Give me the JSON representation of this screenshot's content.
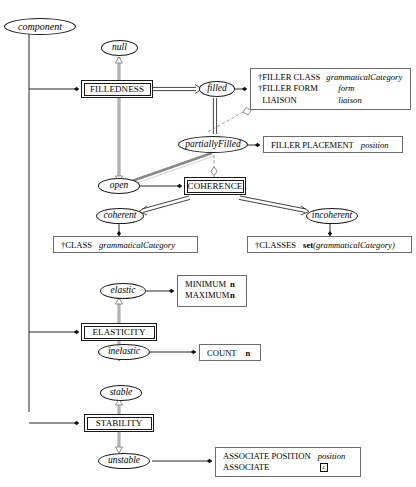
{
  "diagram": {
    "type": "state-transition-attribute-diagram",
    "title": "component",
    "colors": {
      "stroke": "#1a1a1a",
      "thick_gray": "#9a9a9a",
      "box_border": "#6b6b6b",
      "background": "#ffffff"
    },
    "root": {
      "label": "component"
    },
    "states": [
      {
        "id": "null",
        "label": "null"
      },
      {
        "id": "filled",
        "label": "filled"
      },
      {
        "id": "partiallyFilled",
        "label": "partiallyFilled"
      },
      {
        "id": "open",
        "label": "open"
      },
      {
        "id": "coherent",
        "label": "coherent"
      },
      {
        "id": "incoherent",
        "label": "incoherent"
      },
      {
        "id": "elastic",
        "label": "elastic"
      },
      {
        "id": "inelastic",
        "label": "inelastic"
      },
      {
        "id": "stable",
        "label": "stable"
      },
      {
        "id": "unstable",
        "label": "unstable"
      }
    ],
    "classes": [
      {
        "id": "filledness",
        "label": "FILLEDNESS"
      },
      {
        "id": "coherence",
        "label": "COHERENCE"
      },
      {
        "id": "elasticity",
        "label": "ELASTICITY"
      },
      {
        "id": "stability",
        "label": "STABILITY"
      }
    ],
    "attribute_boxes": [
      {
        "id": "filler-class-box",
        "rows": [
          {
            "dagger": true,
            "name": "FILLER CLASS",
            "value": "grammaticalCategory"
          },
          {
            "dagger": true,
            "name": "FILLER FORM",
            "value": "form"
          },
          {
            "dagger": false,
            "name": "LIAISON",
            "value": "liaison"
          }
        ]
      },
      {
        "id": "filler-placement-box",
        "rows": [
          {
            "dagger": false,
            "name": "FILLER PLACEMENT",
            "value": "position"
          }
        ]
      },
      {
        "id": "class-box",
        "rows": [
          {
            "dagger": true,
            "name": "CLASS",
            "value": "grammaticalCategory"
          }
        ]
      },
      {
        "id": "classes-box",
        "rows": [
          {
            "dagger": true,
            "name": "CLASSES",
            "value": "set(grammaticalCategory)",
            "value_kind": "set"
          }
        ]
      },
      {
        "id": "minmax-box",
        "rows": [
          {
            "dagger": false,
            "name": "MINIMUM",
            "value": "n",
            "value_kind": "bold"
          },
          {
            "dagger": false,
            "name": "MAXIMUM",
            "value": "n",
            "value_kind": "bold"
          }
        ]
      },
      {
        "id": "count-box",
        "rows": [
          {
            "dagger": false,
            "name": "COUNT",
            "value": "n",
            "value_kind": "bold"
          }
        ]
      },
      {
        "id": "associate-box",
        "rows": [
          {
            "dagger": false,
            "name": "ASSOCIATE POSITION",
            "value": "position"
          },
          {
            "dagger": false,
            "name": "ASSOCIATE",
            "value": "c",
            "value_kind": "boxed"
          }
        ]
      }
    ],
    "labels": {
      "component": "component",
      "null": "null",
      "filled": "filled",
      "partiallyFilled": "partiallyFilled",
      "open": "open",
      "coherent": "coherent",
      "incoherent": "incoherent",
      "elastic": "elastic",
      "inelastic": "inelastic",
      "stable": "stable",
      "unstable": "unstable",
      "FILLEDNESS": "FILLEDNESS",
      "COHERENCE": "COHERENCE",
      "ELASTICITY": "ELASTICITY",
      "STABILITY": "STABILITY",
      "filler_class_name": "FILLER CLASS",
      "filler_class_value": "grammaticalCategory",
      "filler_form_name": "FILLER FORM",
      "filler_form_value": "form",
      "liaison_name": "LIAISON",
      "liaison_value": "liaison",
      "filler_placement_name": "FILLER PLACEMENT",
      "filler_placement_value": "position",
      "class_name": "CLASS",
      "class_value": "grammaticalCategory",
      "classes_name": "CLASSES",
      "classes_value_fn": "set",
      "classes_value_arg": "(grammaticalCategory)",
      "minimum_name": "MINIMUM",
      "minimum_value": "n",
      "maximum_name": "MAXIMUM",
      "maximum_value": "n",
      "count_name": "COUNT",
      "count_value": "n",
      "associate_position_name": "ASSOCIATE POSITION",
      "associate_position_value": "position",
      "associate_name": "ASSOCIATE",
      "associate_value": "c",
      "dagger": "†"
    }
  }
}
